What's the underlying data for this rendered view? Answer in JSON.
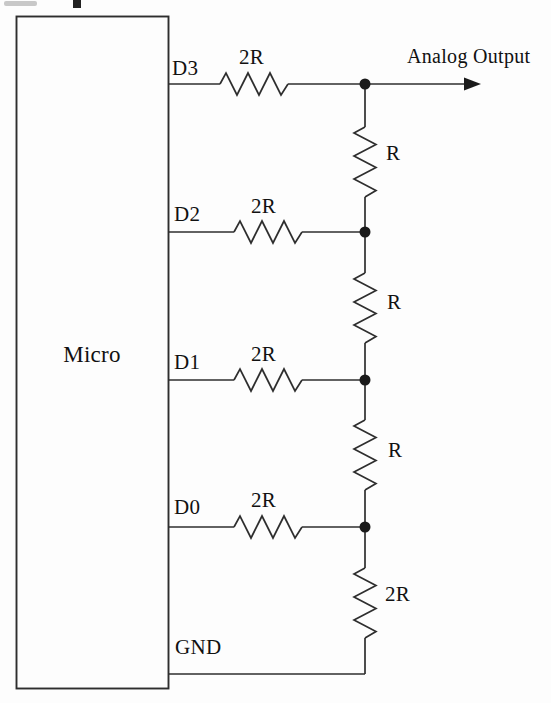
{
  "diagram": {
    "micro_label": "Micro",
    "output_label": "Analog Output",
    "ground_label": "GND",
    "bits": [
      {
        "pin": "D3",
        "resistor": "2R"
      },
      {
        "pin": "D2",
        "resistor": "2R"
      },
      {
        "pin": "D1",
        "resistor": "2R"
      },
      {
        "pin": "D0",
        "resistor": "2R"
      }
    ],
    "ladder": [
      {
        "resistor": "R"
      },
      {
        "resistor": "R"
      },
      {
        "resistor": "R"
      }
    ],
    "termination_resistor": "2R",
    "colors": {
      "line": "#2e2e2e",
      "text": "#111111",
      "paper": "#fdfdfd"
    }
  }
}
